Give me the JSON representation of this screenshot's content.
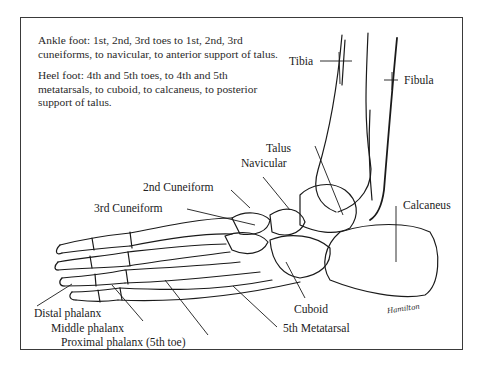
{
  "description": {
    "ankle_foot": "Ankle foot: 1st, 2nd, 3rd toes to 1st, 2nd, 3rd cuneiforms, to navicular, to anterior support of talus.",
    "heel_foot": "Heel foot: 4th and 5th toes, to 4th and 5th metatarsals, to cuboid, to calcaneus, to posterior support of talus."
  },
  "labels": {
    "tibia": "Tibia",
    "fibula": "Fibula",
    "talus": "Talus",
    "navicular": "Navicular",
    "cuneiform_2": "2nd Cuneiform",
    "cuneiform_3": "3rd Cuneiform",
    "calcaneus": "Calcaneus",
    "cuboid": "Cuboid",
    "metatarsal_5": "5th Metatarsal",
    "distal_phalanx": "Distal phalanx",
    "middle_phalanx": "Middle phalanx",
    "proximal_phalanx": "Proximal phalanx (5th toe)"
  },
  "signature": "Hamilton",
  "colors": {
    "ink": "#1a1a1a",
    "frame": "#3a3a3a",
    "background": "#ffffff"
  }
}
